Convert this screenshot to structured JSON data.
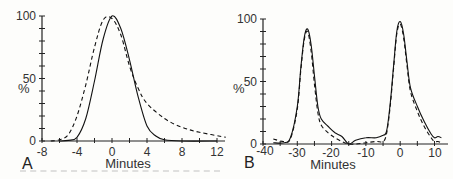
{
  "chart_data": [
    {
      "panel": "A",
      "type": "line",
      "xlabel": "Minutes",
      "ylabel": "%",
      "xlim": [
        -8,
        13
      ],
      "ylim": [
        0,
        100
      ],
      "xticks": [
        -8,
        -4,
        0,
        4,
        8,
        12
      ],
      "yticks": [
        0,
        50,
        100
      ],
      "grid": false,
      "series": [
        {
          "name": "solid",
          "style": "solid",
          "x": [
            -6,
            -5,
            -4,
            -3,
            -2,
            -1,
            0,
            1,
            2,
            3,
            4,
            5,
            6,
            8,
            12
          ],
          "y": [
            0,
            0.5,
            3,
            18,
            48,
            82,
            100,
            90,
            65,
            35,
            12,
            4,
            1,
            0,
            0
          ]
        },
        {
          "name": "dashed",
          "style": "dashed",
          "x": [
            -7,
            -6,
            -5,
            -4,
            -3,
            -2,
            -1,
            0,
            1,
            2,
            3,
            4,
            6,
            8,
            10,
            13
          ],
          "y": [
            0,
            1,
            5,
            20,
            45,
            75,
            97,
            98,
            85,
            60,
            42,
            30,
            18,
            11,
            7,
            3
          ]
        }
      ]
    },
    {
      "panel": "B",
      "type": "line",
      "xlabel": "Minutes",
      "ylabel": "%",
      "xlim": [
        -40,
        12
      ],
      "ylim": [
        0,
        100
      ],
      "xticks": [
        -40,
        -30,
        -20,
        -10,
        0,
        10
      ],
      "yticks": [
        0,
        50,
        100
      ],
      "grid": false,
      "series": [
        {
          "name": "solid",
          "style": "solid",
          "x": [
            -37,
            -34,
            -32,
            -30,
            -29,
            -28,
            -27,
            -26,
            -25,
            -24,
            -23,
            -21,
            -19,
            -17,
            -15,
            -13,
            -10,
            -7,
            -5,
            -4,
            -3,
            -2,
            -1,
            0,
            1,
            2,
            3,
            5,
            7,
            9,
            10,
            11,
            12
          ],
          "y": [
            1,
            1,
            5,
            30,
            60,
            85,
            92,
            80,
            55,
            30,
            20,
            14,
            9,
            6,
            0,
            3,
            5,
            5,
            7,
            10,
            30,
            60,
            90,
            98,
            88,
            65,
            45,
            30,
            18,
            8,
            5,
            6,
            5
          ]
        },
        {
          "name": "dashed",
          "style": "dashed",
          "x": [
            -37,
            -34,
            -32,
            -30,
            -29,
            -28,
            -27,
            -26,
            -25,
            -24,
            -23,
            -21,
            -19,
            -17,
            -15,
            -13,
            -10,
            -7,
            -5,
            -4,
            -3,
            -2,
            -1,
            0,
            1,
            2,
            3,
            5,
            7,
            9,
            10,
            11,
            12
          ],
          "y": [
            4,
            2,
            4,
            28,
            58,
            83,
            90,
            75,
            48,
            25,
            15,
            9,
            5,
            2,
            0,
            0,
            1,
            2,
            2,
            8,
            28,
            58,
            88,
            96,
            85,
            62,
            42,
            26,
            14,
            5,
            2,
            2,
            1
          ]
        }
      ]
    }
  ],
  "panels": {
    "a": {
      "letter": "A",
      "xlabel": "Minutes",
      "ylabel": "%",
      "xticks": [
        "-8",
        "-4",
        "0",
        "4",
        "8",
        "12"
      ],
      "yticks": [
        "0",
        "50",
        "100"
      ]
    },
    "b": {
      "letter": "B",
      "xlabel": "Minutes",
      "ylabel": "%",
      "xticks": [
        "-40",
        "-30",
        "-20",
        "-10",
        "0",
        "10"
      ],
      "yticks": [
        "0",
        "50",
        "100"
      ]
    }
  }
}
